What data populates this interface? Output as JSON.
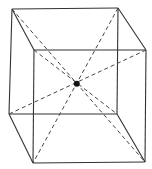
{
  "diagram": {
    "type": "cube-oblique-projection",
    "vertices": [
      "back-top-left",
      "back-top-right",
      "back-bottom-left",
      "back-bottom-right",
      "front-top-left",
      "front-top-right",
      "front-bottom-left",
      "front-bottom-right"
    ],
    "edges": [
      [
        "back-top-left",
        "back-top-right"
      ],
      [
        "back-top-right",
        "back-bottom-right"
      ],
      [
        "back-bottom-right",
        "back-bottom-left"
      ],
      [
        "back-bottom-left",
        "back-top-left"
      ],
      [
        "front-top-left",
        "front-top-right"
      ],
      [
        "front-top-right",
        "front-bottom-right"
      ],
      [
        "front-bottom-right",
        "front-bottom-left"
      ],
      [
        "front-bottom-left",
        "front-top-left"
      ],
      [
        "back-top-left",
        "front-top-left"
      ],
      [
        "back-top-right",
        "front-top-right"
      ],
      [
        "back-bottom-left",
        "front-bottom-left"
      ],
      [
        "back-bottom-right",
        "front-bottom-right"
      ]
    ],
    "diagonals": [
      [
        "back-top-left",
        "front-bottom-right"
      ],
      [
        "back-top-right",
        "front-bottom-left"
      ],
      [
        "front-top-left",
        "back-bottom-right"
      ],
      [
        "front-top-right",
        "back-bottom-left"
      ]
    ],
    "center_point": "intersection-of-diagonals",
    "colors": {
      "line": "#333333",
      "point": "#111111"
    }
  }
}
